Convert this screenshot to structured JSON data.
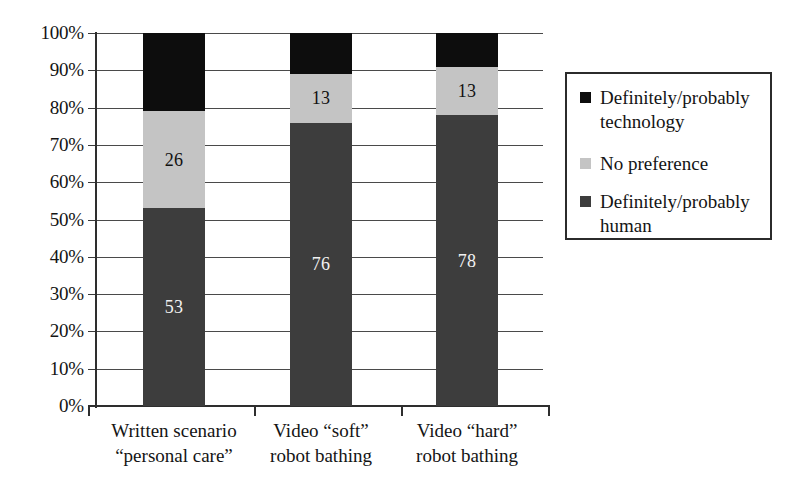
{
  "chart_data": {
    "type": "bar",
    "subtype": "stacked-bar-100-percent",
    "title": "",
    "xlabel": "",
    "ylabel": "",
    "ylim": [
      0,
      100
    ],
    "ytick_labels": [
      "100%",
      "90%",
      "80%",
      "70%",
      "60%",
      "50%",
      "40%",
      "30%",
      "20%",
      "10%",
      "0%"
    ],
    "ytick_values": [
      100,
      90,
      80,
      70,
      60,
      50,
      40,
      30,
      20,
      10,
      0
    ],
    "grid": true,
    "legend_position": "right",
    "categories": [
      "Written scenario\n“personal care”",
      "Video “soft”\nrobot bathing",
      "Video “hard”\nrobot bathing"
    ],
    "category_lines": [
      [
        "Written scenario",
        "“personal care”"
      ],
      [
        "Video “soft”",
        "robot bathing"
      ],
      [
        "Video “hard”",
        "robot bathing"
      ]
    ],
    "series": [
      {
        "name": "Definitely/probably human",
        "color": "#3d3d3d",
        "values": [
          53,
          76,
          78
        ],
        "labels": [
          "53",
          "76",
          "78"
        ],
        "label_color": "#f2f2f2"
      },
      {
        "name": "No preference",
        "color": "#c4c4c4",
        "values": [
          26,
          13,
          13
        ],
        "labels": [
          "26",
          "13",
          "13"
        ],
        "label_color": "#111111"
      },
      {
        "name": "Definitely/probably technology",
        "color": "#0d0d0d",
        "values": [
          21,
          11,
          9
        ],
        "labels": [
          "",
          "",
          ""
        ],
        "label_color": "#ffffff"
      }
    ]
  },
  "legend": {
    "items": [
      {
        "swatch_color": "#0d0d0d",
        "line1": "Definitely/probably",
        "line2": "technology"
      },
      {
        "swatch_color": "#c4c4c4",
        "line1": "No preference",
        "line2": ""
      },
      {
        "swatch_color": "#3d3d3d",
        "line1": "Definitely/probably",
        "line2": "human"
      }
    ]
  },
  "axis": {
    "ticks": [
      {
        "label": "100%"
      },
      {
        "label": "90%"
      },
      {
        "label": "80%"
      },
      {
        "label": "70%"
      },
      {
        "label": "60%"
      },
      {
        "label": "50%"
      },
      {
        "label": "40%"
      },
      {
        "label": "30%"
      },
      {
        "label": "20%"
      },
      {
        "label": "10%"
      },
      {
        "label": "0%"
      }
    ]
  }
}
